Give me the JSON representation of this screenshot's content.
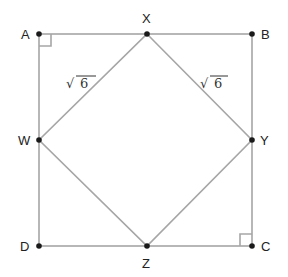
{
  "diagram": {
    "type": "geometry",
    "outer_square": [
      "A",
      "B",
      "C",
      "D"
    ],
    "inner_square": [
      "X",
      "Y",
      "Z",
      "W"
    ],
    "points": {
      "A": {
        "label": "A",
        "x": 39,
        "y": 34
      },
      "X": {
        "label": "X",
        "x": 147,
        "y": 34
      },
      "B": {
        "label": "B",
        "x": 252,
        "y": 34
      },
      "W": {
        "label": "W",
        "x": 39,
        "y": 140
      },
      "Y": {
        "label": "Y",
        "x": 252,
        "y": 140
      },
      "D": {
        "label": "D",
        "x": 39,
        "y": 246
      },
      "Z": {
        "label": "Z",
        "x": 147,
        "y": 246
      },
      "C": {
        "label": "C",
        "x": 252,
        "y": 246
      }
    },
    "measurements": [
      {
        "segment": "WX",
        "label_radical": "√",
        "label_value": "6"
      },
      {
        "segment": "XY",
        "label_radical": "√",
        "label_value": "6"
      }
    ],
    "right_angle_markers": [
      "A",
      "C"
    ],
    "colors": {
      "line": "#a6a6a6",
      "point": "#1a1a1a",
      "text": "#222222"
    }
  }
}
